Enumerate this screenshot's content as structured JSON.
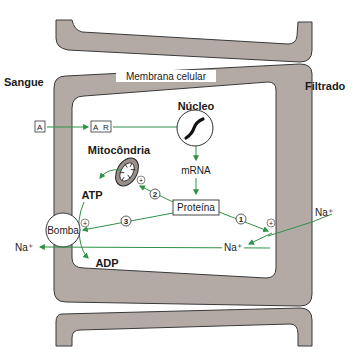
{
  "labels": {
    "blood_side": "Sangue",
    "filtrate_side": "Filtrado",
    "membrane": "Membrana celular",
    "nucleus": "Núcleo",
    "mrna": "mRNA",
    "protein": "Proteína",
    "mitochondria": "Mitocôndria",
    "atp": "ATP",
    "adp": "ADP",
    "pump": "Bomba",
    "hormone": "A",
    "receptor_complex_a": "A",
    "receptor_complex_r": "R",
    "sodium_left": "Na⁺",
    "sodium_inside": "Na⁺",
    "sodium_right": "Na⁺",
    "plus": "+"
  },
  "steps": [
    {
      "number": "1",
      "target": "sodium channel"
    },
    {
      "number": "2",
      "target": "mitochondria"
    },
    {
      "number": "3",
      "target": "pump"
    }
  ],
  "colors": {
    "membrane_fill": "#b3aaa6",
    "membrane_stroke": "#3a3a3a",
    "arrow_green": "#2e9146",
    "background": "#ffffff"
  }
}
